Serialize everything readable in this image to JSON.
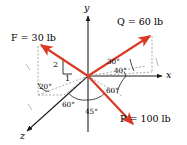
{
  "figure": {
    "kind": "force-vector-diagram",
    "background": "#ffffff",
    "width": 187,
    "height": 145
  },
  "colors": {
    "vector_red": "#d83a23",
    "axis_black": "#1a1a1a",
    "dashed_gray": "#9a9a9a",
    "text_black": "#000000"
  },
  "axes": [
    {
      "name": "y-axis",
      "label": "y",
      "direction": "up"
    },
    {
      "name": "x-axis",
      "label": "x",
      "direction": "right"
    },
    {
      "name": "z-axis",
      "label": "z",
      "direction": "down-left"
    }
  ],
  "axis_labels": {
    "y": "y",
    "x": "x",
    "z": "z"
  },
  "forces": [
    {
      "name": "F",
      "label": "F = 30 lb",
      "symbol": "F",
      "equals": "=",
      "magnitude": "30 lb",
      "value": 30,
      "units": "lb",
      "direction": "upper-left"
    },
    {
      "name": "Q",
      "label": "Q = 60 lb",
      "symbol": "Q",
      "equals": "=",
      "magnitude": "60 lb",
      "value": 60,
      "units": "lb",
      "direction": "upper-right"
    },
    {
      "name": "P",
      "label": "P = 100 lb",
      "symbol": "P",
      "equals": "=",
      "magnitude": "100 lb",
      "value": 100,
      "units": "lb",
      "direction": "lower-right"
    }
  ],
  "angles": [
    {
      "name": "angle-20",
      "text": "20°",
      "value": 20
    },
    {
      "name": "angle-60-left",
      "text": "60°",
      "value": 60
    },
    {
      "name": "angle-45",
      "text": "45°",
      "value": 45
    },
    {
      "name": "angle-60-right",
      "text": "60°",
      "value": 60
    },
    {
      "name": "angle-30",
      "text": "30°",
      "value": 30
    },
    {
      "name": "angle-40",
      "text": "40°",
      "value": 40
    }
  ],
  "slope_triangle": {
    "name": "slope-triangle-2-1",
    "rise": "2",
    "run": "1",
    "ratio": "2:1"
  }
}
